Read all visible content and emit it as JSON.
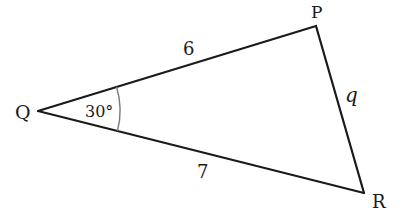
{
  "diagram": {
    "type": "triangle",
    "vertices": {
      "Q": {
        "label": "Q"
      },
      "P": {
        "label": "P"
      },
      "R": {
        "label": "R"
      }
    },
    "sides": {
      "QP": {
        "label": "6"
      },
      "QR": {
        "label": "7"
      },
      "PR": {
        "label": "q"
      }
    },
    "angle_Q": {
      "label": "30°"
    }
  },
  "colors": {
    "line": "#1a1a1a",
    "arc": "#7a7a7a",
    "background": "#ffffff"
  }
}
